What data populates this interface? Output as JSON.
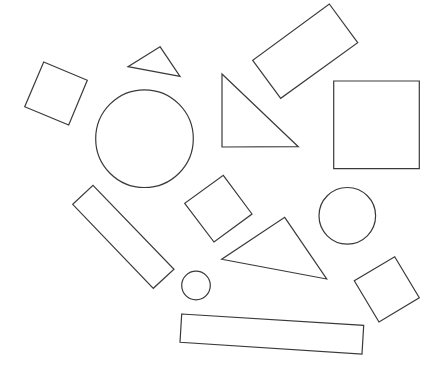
{
  "canvas": {
    "width": 444,
    "height": 373,
    "background": "#ffffff"
  },
  "style": {
    "stroke": "#3a3a3a",
    "stroke_width": 1.2,
    "fill": "none"
  },
  "shapes": [
    {
      "type": "polygon",
      "kind": "square",
      "name": "tilted-square-left",
      "points": [
        [
          43.7,
          62
        ],
        [
          87.3,
          80.3
        ],
        [
          68.7,
          125
        ],
        [
          24.7,
          106.7
        ]
      ]
    },
    {
      "type": "polygon",
      "kind": "triangle",
      "name": "small-triangle-top",
      "points": [
        [
          160,
          46.7
        ],
        [
          180,
          76.3
        ],
        [
          128,
          66.7
        ]
      ]
    },
    {
      "type": "circle",
      "kind": "circle",
      "name": "large-circle",
      "cx": 144.5,
      "cy": 138.7,
      "r": 48.8
    },
    {
      "type": "polygon",
      "kind": "rectangle",
      "name": "rotated-rectangle-top",
      "points": [
        [
          329.3,
          4
        ],
        [
          357.7,
          42.7
        ],
        [
          280.7,
          98.3
        ],
        [
          252.7,
          60.3
        ]
      ]
    },
    {
      "type": "polygon",
      "kind": "triangle",
      "name": "right-triangle",
      "points": [
        [
          222,
          74
        ],
        [
          298.3,
          146.7
        ],
        [
          222,
          147
        ]
      ]
    },
    {
      "type": "polygon",
      "kind": "square",
      "name": "axis-aligned-square",
      "points": [
        [
          333.7,
          81
        ],
        [
          419.3,
          81
        ],
        [
          419.3,
          168.7
        ],
        [
          333.7,
          168.7
        ]
      ]
    },
    {
      "type": "polygon",
      "kind": "rectangle",
      "name": "long-tilted-rectangle",
      "points": [
        [
          93,
          185.3
        ],
        [
          174,
          269.3
        ],
        [
          153.3,
          288.3
        ],
        [
          72.7,
          204.3
        ]
      ]
    },
    {
      "type": "circle",
      "kind": "circle",
      "name": "small-circle",
      "cx": 196,
      "cy": 285.5,
      "r": 14.3
    },
    {
      "type": "polygon",
      "kind": "square",
      "name": "diamond-square-center",
      "points": [
        [
          223.3,
          175.3
        ],
        [
          252,
          214
        ],
        [
          214,
          242
        ],
        [
          184.7,
          203.3
        ]
      ]
    },
    {
      "type": "polygon",
      "kind": "triangle",
      "name": "middle-triangle",
      "points": [
        [
          284.7,
          217.3
        ],
        [
          326.7,
          279
        ],
        [
          221.7,
          259.3
        ]
      ]
    },
    {
      "type": "circle",
      "kind": "circle",
      "name": "medium-circle-right",
      "cx": 347.3,
      "cy": 215.8,
      "r": 28.3
    },
    {
      "type": "polygon",
      "kind": "square",
      "name": "tilted-square-bottom-right",
      "points": [
        [
          394.7,
          256.7
        ],
        [
          419.3,
          297.7
        ],
        [
          379,
          322
        ],
        [
          354.3,
          280.7
        ]
      ]
    },
    {
      "type": "polygon",
      "kind": "rectangle",
      "name": "long-rectangle-bottom",
      "points": [
        [
          181.7,
          314
        ],
        [
          363.7,
          325.3
        ],
        [
          362,
          354
        ],
        [
          180,
          342.3
        ]
      ]
    }
  ]
}
